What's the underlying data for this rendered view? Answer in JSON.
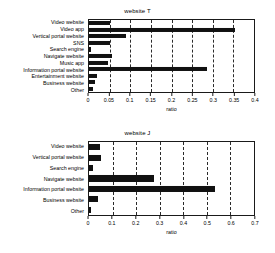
{
  "figure": {
    "background": "#ffffff",
    "bar_color": "#111111",
    "axis_color": "#1a1a1a",
    "grid_color": "#2b2b2b"
  },
  "chart_data": [
    {
      "type": "bar",
      "orientation": "horizontal",
      "title": "website T",
      "xlabel": "ratio",
      "ylabel": "",
      "xlim": [
        0,
        0.4
      ],
      "xticks": [
        0,
        0.05,
        0.1,
        0.15,
        0.2,
        0.25,
        0.3,
        0.35,
        0.4
      ],
      "xticklabels": [
        "0",
        "0.05",
        "0.1",
        "0.15",
        "0.2",
        "0.25",
        "0.3",
        "0.35",
        "0.4"
      ],
      "grid": "x-dashed",
      "legend": "none",
      "categories": [
        "Video website",
        "Video app",
        "Vertical portal website",
        "SNS",
        "Search engine",
        "Navigate website",
        "Music app",
        "Information portal website",
        "Entertainment website",
        "Business website",
        "Other"
      ],
      "values": [
        0.05,
        0.355,
        0.09,
        0.05,
        0.005,
        0.055,
        0.045,
        0.285,
        0.02,
        0.015,
        0.01
      ]
    },
    {
      "type": "bar",
      "orientation": "horizontal",
      "title": "website J",
      "xlabel": "ratio",
      "ylabel": "",
      "xlim": [
        0,
        0.7
      ],
      "xticks": [
        0,
        0.1,
        0.2,
        0.3,
        0.4,
        0.5,
        0.6,
        0.7
      ],
      "xticklabels": [
        "0",
        "0.1",
        "0.2",
        "0.3",
        "0.4",
        "0.5",
        "0.6",
        "0.7"
      ],
      "grid": "x-dashed",
      "legend": "none",
      "categories": [
        "Video website",
        "Vertical portal website",
        "Search engine",
        "Navigate website",
        "Information portal website",
        "Business website",
        "Other"
      ],
      "values": [
        0.045,
        0.05,
        0.015,
        0.275,
        0.535,
        0.04,
        0.01
      ]
    }
  ]
}
